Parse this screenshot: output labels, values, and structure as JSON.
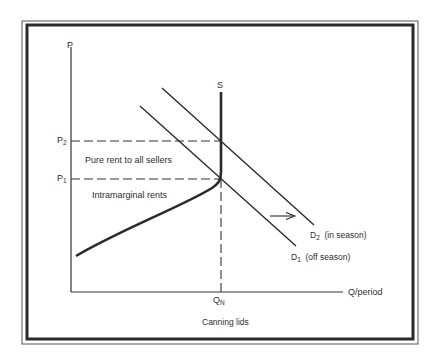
{
  "diagram": {
    "caption": "Canning lids",
    "axes": {
      "y_label": "P",
      "x_label": "Q/period"
    },
    "price_levels": [
      {
        "label": "P",
        "subscript": "2"
      },
      {
        "label": "P",
        "subscript": "1"
      }
    ],
    "quantity_level": {
      "label": "Q",
      "subscript": "N"
    },
    "curves": {
      "supply": {
        "label": "S"
      },
      "demand_in_season": {
        "label": "D",
        "subscript": "2",
        "note": "(in season)"
      },
      "demand_off_season": {
        "label": "D",
        "subscript": "1",
        "note": "(off season)"
      }
    },
    "regions": {
      "pure_rent": "Pure rent to all sellers",
      "intramarginal": "Intramarginal rents"
    },
    "shift_arrow": "demand shift right"
  },
  "colors": {
    "ink": "#2a2a2a",
    "background": "#ffffff"
  }
}
